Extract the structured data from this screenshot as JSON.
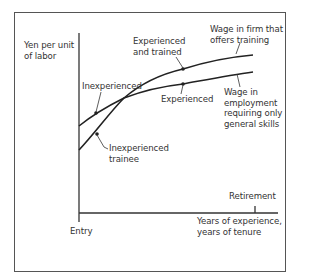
{
  "diagram": {
    "type": "line-diagram",
    "y_axis_label": [
      "Yen per unit",
      "of labor"
    ],
    "x_axis_label": [
      "Years of experience,",
      "years of tenure"
    ],
    "x_markers": {
      "entry": "Entry",
      "retirement": "Retirement"
    },
    "curves": [
      {
        "name": "Wage in firm that offers training",
        "label_lines": [
          "Wage in firm that",
          "offers training"
        ],
        "points": {
          "start": "Inexperienced trainee",
          "end": "Experienced and trained"
        },
        "path": "M79,150 C95,133 110,112 124,98 C145,80 170,72 183,69 C205,62 230,57 253,55"
      },
      {
        "name": "Wage in employment requiring only general skills",
        "label_lines": [
          "Wage in",
          "employment",
          "requiring only",
          "general skills"
        ],
        "points": {
          "start": "Inexperienced",
          "end": "Experienced"
        },
        "path": "M79,126 C95,113 110,105 124,98 C145,90 165,86 183,84 C205,80 230,75 253,72"
      }
    ],
    "annotations": {
      "inexperienced": "Inexperienced",
      "inexperienced_trainee": [
        "Inexperienced",
        "trainee"
      ],
      "experienced": "Experienced",
      "experienced_trained": [
        "Experienced",
        "and trained"
      ]
    }
  }
}
